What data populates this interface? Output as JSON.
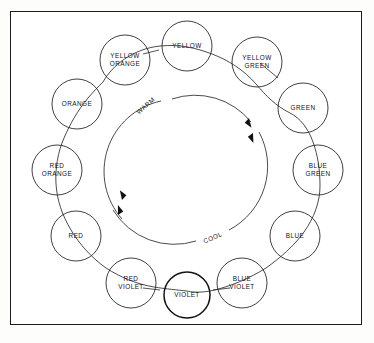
{
  "diagram": {
    "frame": {
      "stroke": "#1b1b1b"
    },
    "ink_color": "#2a2a2a",
    "background": "#ffffff",
    "temperature_labels": [
      {
        "id": "warm",
        "text": "WARM",
        "x": 146,
        "y": 106,
        "rotation": -42
      },
      {
        "id": "cool",
        "text": "COOL",
        "x": 213,
        "y": 238,
        "rotation": -23
      }
    ],
    "inner_ring": {
      "cx": 187,
      "cy": 170,
      "r": 72
    },
    "hues": [
      {
        "id": "yellow",
        "label_lines": [
          "YELLOW"
        ],
        "cx": 187,
        "cy": 46,
        "r": 25
      },
      {
        "id": "yellow-green",
        "label_lines": [
          "YELLOW",
          "GREEN"
        ],
        "cx": 257,
        "cy": 62,
        "r": 25
      },
      {
        "id": "green",
        "label_lines": [
          "GREEN"
        ],
        "cx": 303,
        "cy": 108,
        "r": 25
      },
      {
        "id": "blue-green",
        "label_lines": [
          "BLUE",
          "GREEN"
        ],
        "cx": 318,
        "cy": 170,
        "r": 25
      },
      {
        "id": "blue",
        "label_lines": [
          "BLUE"
        ],
        "cx": 295,
        "cy": 236,
        "r": 25
      },
      {
        "id": "blue-violet",
        "label_lines": [
          "BLUE",
          "VIOLET"
        ],
        "cx": 242,
        "cy": 283,
        "r": 25
      },
      {
        "id": "violet",
        "label_lines": [
          "VIOLET"
        ],
        "cx": 187,
        "cy": 295,
        "r": 23,
        "heavy": true
      },
      {
        "id": "red-violet",
        "label_lines": [
          "RED",
          "VIOLET"
        ],
        "cx": 131,
        "cy": 283,
        "r": 25
      },
      {
        "id": "red",
        "label_lines": [
          "RED"
        ],
        "cx": 76,
        "cy": 236,
        "r": 25
      },
      {
        "id": "red-orange",
        "label_lines": [
          "RED",
          "ORANGE"
        ],
        "cx": 57,
        "cy": 170,
        "r": 25
      },
      {
        "id": "orange",
        "label_lines": [
          "ORANGE"
        ],
        "cx": 77,
        "cy": 104,
        "r": 25
      },
      {
        "id": "yellow-orange",
        "label_lines": [
          "YELLOW",
          "ORANGE"
        ],
        "cx": 125,
        "cy": 60,
        "r": 25
      }
    ],
    "arrows": [
      {
        "id": "arrow-warm-to-cool-upper",
        "x": 253,
        "y": 123,
        "rotation": 52
      },
      {
        "id": "arrow-warm-to-cool-lower",
        "x": 257,
        "y": 137,
        "rotation": 62
      },
      {
        "id": "arrow-cool-to-warm-upper",
        "x": 117,
        "y": 204,
        "rotation": 235
      },
      {
        "id": "arrow-cool-to-warm-lower",
        "x": 113,
        "y": 216,
        "rotation": 244
      }
    ]
  }
}
